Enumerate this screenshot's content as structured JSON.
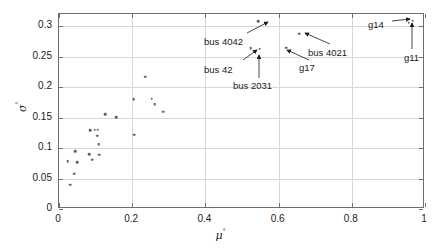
{
  "chart_data": {
    "type": "scatter",
    "title": "",
    "xlabel": "μ°",
    "ylabel": "σ°",
    "xlabel_base": "μ",
    "xlabel_sup": "°",
    "ylabel_base": "σ",
    "ylabel_sup": "°",
    "xlim": [
      0,
      1
    ],
    "ylim": [
      0,
      0.32
    ],
    "grid": true,
    "legend": "none",
    "xticks": [
      0,
      0.2,
      0.4,
      0.6,
      0.8,
      1
    ],
    "xticklabels": [
      "0",
      "0.2",
      "0.4",
      "0.6",
      "0.8",
      "1"
    ],
    "yticks": [
      0,
      0.05,
      0.1,
      0.15,
      0.2,
      0.25,
      0.3
    ],
    "yticklabels": [
      "0",
      "0.05",
      "0.1",
      "0.15",
      "0.2",
      "0.25",
      "0.3"
    ],
    "marker_color": "#5f6368",
    "axis_color": "#6e6e6e",
    "grid_color": "#d8d8d8",
    "points": [
      {
        "x": 0.024,
        "y": 0.078
      },
      {
        "x": 0.031,
        "y": 0.04
      },
      {
        "x": 0.042,
        "y": 0.058
      },
      {
        "x": 0.044,
        "y": 0.095
      },
      {
        "x": 0.05,
        "y": 0.077
      },
      {
        "x": 0.083,
        "y": 0.09
      },
      {
        "x": 0.086,
        "y": 0.129
      },
      {
        "x": 0.09,
        "y": 0.081
      },
      {
        "x": 0.098,
        "y": 0.13
      },
      {
        "x": 0.104,
        "y": 0.12
      },
      {
        "x": 0.106,
        "y": 0.13
      },
      {
        "x": 0.108,
        "y": 0.106
      },
      {
        "x": 0.11,
        "y": 0.089
      },
      {
        "x": 0.127,
        "y": 0.156
      },
      {
        "x": 0.156,
        "y": 0.151
      },
      {
        "x": 0.204,
        "y": 0.18
      },
      {
        "x": 0.206,
        "y": 0.122
      },
      {
        "x": 0.236,
        "y": 0.217
      },
      {
        "x": 0.253,
        "y": 0.181
      },
      {
        "x": 0.262,
        "y": 0.172
      },
      {
        "x": 0.285,
        "y": 0.16
      },
      {
        "x": 0.524,
        "y": 0.264
      },
      {
        "x": 0.544,
        "y": 0.308
      },
      {
        "x": 0.548,
        "y": 0.263
      },
      {
        "x": 0.62,
        "y": 0.265
      },
      {
        "x": 0.657,
        "y": 0.288
      },
      {
        "x": 0.955,
        "y": 0.306
      },
      {
        "x": 0.966,
        "y": 0.309
      }
    ],
    "annotations": [
      {
        "label": "bus 4042",
        "text_x": 204,
        "text_y": 36,
        "arrow_from_x": 247,
        "arrow_from_y": 33,
        "arrow_to_x": 268,
        "arrow_to_y": 22
      },
      {
        "label": "bus 42",
        "text_x": 204,
        "text_y": 64,
        "arrow_from_x": 243,
        "arrow_from_y": 60,
        "arrow_to_x": 257,
        "arrow_to_y": 50
      },
      {
        "label": "bus 2031",
        "text_x": 233,
        "text_y": 80,
        "arrow_from_x": 259,
        "arrow_from_y": 78,
        "arrow_to_x": 259,
        "arrow_to_y": 55
      },
      {
        "label": "bus 4021",
        "text_x": 308,
        "text_y": 47,
        "arrow_from_x": 330,
        "arrow_from_y": 44,
        "arrow_to_x": 305,
        "arrow_to_y": 33
      },
      {
        "label": "g17",
        "text_x": 299,
        "text_y": 62,
        "arrow_from_x": 309,
        "arrow_from_y": 60,
        "arrow_to_x": 287,
        "arrow_to_y": 50
      },
      {
        "label": "g14",
        "text_x": 368,
        "text_y": 19,
        "arrow_from_x": 392,
        "arrow_from_y": 21,
        "arrow_to_x": 410,
        "arrow_to_y": 19
      },
      {
        "label": "g11",
        "text_x": 404,
        "text_y": 52,
        "arrow_from_x": 412,
        "arrow_from_y": 49,
        "arrow_to_x": 412,
        "arrow_to_y": 23
      }
    ]
  }
}
